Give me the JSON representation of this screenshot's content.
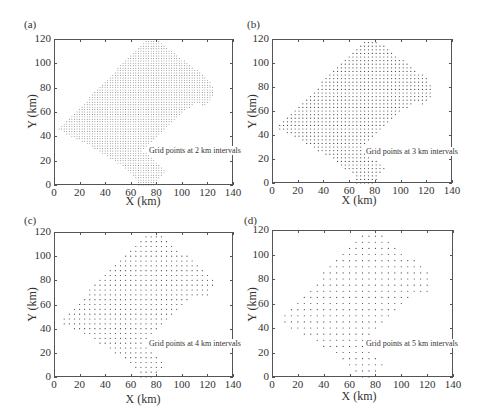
{
  "chart_data": [
    {
      "type": "scatter",
      "panel": "(a)",
      "interval_km": 2,
      "annotation": "Grid points at 2 km intervals",
      "xlabel": "X (km)",
      "ylabel": "Y (km)",
      "xlim": [
        0,
        140
      ],
      "ylim": [
        0,
        120
      ],
      "xticks": [
        0,
        20,
        40,
        60,
        80,
        100,
        120,
        140
      ],
      "yticks": [
        0,
        20,
        40,
        60,
        80,
        100,
        120
      ],
      "grid": false
    },
    {
      "type": "scatter",
      "panel": "(b)",
      "interval_km": 3,
      "annotation": "Grid points at 3 km intervals",
      "xlabel": "X (km)",
      "ylabel": "Y (km)",
      "xlim": [
        0,
        140
      ],
      "ylim": [
        0,
        120
      ],
      "xticks": [
        0,
        20,
        40,
        60,
        80,
        100,
        120,
        140
      ],
      "yticks": [
        0,
        20,
        40,
        60,
        80,
        100,
        120
      ],
      "grid": false
    },
    {
      "type": "scatter",
      "panel": "(c)",
      "interval_km": 4,
      "annotation": "Grid points at 4 km intervals",
      "xlabel": "X (km)",
      "ylabel": "Y (km)",
      "xlim": [
        0,
        140
      ],
      "ylim": [
        0,
        120
      ],
      "xticks": [
        0,
        20,
        40,
        60,
        80,
        100,
        120,
        140
      ],
      "yticks": [
        0,
        20,
        40,
        60,
        80,
        100,
        120
      ],
      "grid": false
    },
    {
      "type": "scatter",
      "panel": "(d)",
      "interval_km": 5,
      "annotation": "Grid points at 5 km intervals",
      "xlabel": "X (km)",
      "ylabel": "Y (km)",
      "xlim": [
        0,
        140
      ],
      "ylim": [
        0,
        120
      ],
      "xticks": [
        0,
        20,
        40,
        60,
        80,
        100,
        120,
        140
      ],
      "yticks": [
        0,
        20,
        40,
        60,
        80,
        100,
        120
      ],
      "grid": false
    }
  ],
  "region_outline_km": [
    [
      4,
      46
    ],
    [
      72,
      120
    ],
    [
      80,
      120
    ],
    [
      122,
      86
    ],
    [
      125,
      80
    ],
    [
      124,
      72
    ],
    [
      118,
      65
    ],
    [
      112,
      68
    ],
    [
      104,
      62
    ],
    [
      70,
      28
    ],
    [
      88,
      12
    ],
    [
      82,
      4
    ],
    [
      80,
      0
    ],
    [
      66,
      0
    ],
    [
      64,
      6
    ],
    [
      50,
      18
    ],
    [
      22,
      36
    ],
    [
      10,
      42
    ]
  ],
  "point_color": "#444444"
}
